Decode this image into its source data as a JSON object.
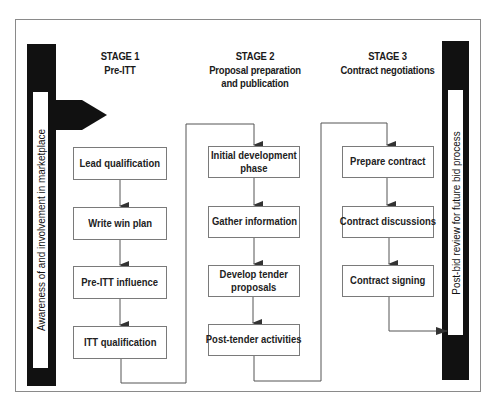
{
  "diagram": {
    "left_bar_label": "Awareness of and involvement in marketplace",
    "right_bar_label": "Post-bid review for future bid process",
    "stages": [
      {
        "title": "STAGE 1",
        "subtitle_lines": [
          "Pre-ITT"
        ],
        "steps": [
          "Lead qualification",
          "Write win plan",
          "Pre-ITT influence",
          "ITT qualification"
        ]
      },
      {
        "title": "STAGE 2",
        "subtitle_lines": [
          "Proposal preparation",
          "and publication"
        ],
        "steps": [
          "Initial development|phase",
          "Gather information",
          "Develop tender|proposals",
          "Post-tender activities"
        ]
      },
      {
        "title": "STAGE 3",
        "subtitle_lines": [
          "Contract negotiations"
        ],
        "steps": [
          "Prepare contract",
          "Contract discussions",
          "Contract signing"
        ]
      }
    ],
    "steps_display": {
      "s2_1_line1": "Initial development",
      "s2_1_line2": "phase",
      "s2_3_line1": "Develop tender",
      "s2_3_line2": "proposals"
    },
    "colors": {
      "bar": "#111111",
      "box_border": "#7a7a7a",
      "frame_border": "#8a8a8a",
      "connector": "#555555"
    }
  }
}
